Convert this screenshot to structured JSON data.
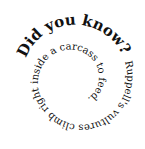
{
  "spiral": {
    "headline": "Did you know?",
    "body": "Ruppell's vultures climb right inside a carcass to feed.",
    "text_color": "#111111",
    "background": "#ffffff"
  }
}
